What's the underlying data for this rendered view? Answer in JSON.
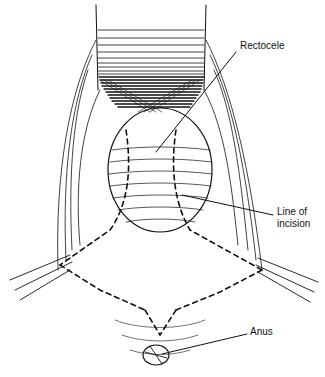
{
  "figure": {
    "labels": {
      "rectocele": "Rectocele",
      "line_of_incision_1": "Line of",
      "line_of_incision_2": "incision",
      "anus": "Anus"
    },
    "colors": {
      "ink": "#111111",
      "background": "#ffffff"
    }
  }
}
